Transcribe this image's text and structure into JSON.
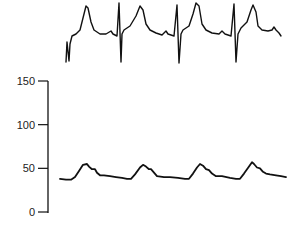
{
  "chart_data": [
    {
      "type": "line",
      "title": "",
      "description": "ECG trace (no axis), aligned above pressure waveform",
      "xlabel": "",
      "ylabel": "",
      "axes_visible": false,
      "beats": 4,
      "qrs_x_px": [
        67,
        119,
        177,
        234
      ],
      "series": [
        {
          "name": "ECG",
          "points_px": [
            [
              66,
              62
            ],
            [
              67,
              42
            ],
            [
              69,
              61
            ],
            [
              70,
              44
            ],
            [
              72,
              36
            ],
            [
              76,
              34
            ],
            [
              80,
              30
            ],
            [
              83,
              18
            ],
            [
              86,
              6
            ],
            [
              88,
              8
            ],
            [
              91,
              22
            ],
            [
              94,
              30
            ],
            [
              100,
              34
            ],
            [
              106,
              34
            ],
            [
              111,
              31
            ],
            [
              113,
              34
            ],
            [
              117,
              36
            ],
            [
              119,
              3
            ],
            [
              121,
              62
            ],
            [
              122,
              34
            ],
            [
              124,
              30
            ],
            [
              130,
              26
            ],
            [
              136,
              16
            ],
            [
              140,
              6
            ],
            [
              143,
              10
            ],
            [
              146,
              24
            ],
            [
              150,
              30
            ],
            [
              156,
              33
            ],
            [
              162,
              35
            ],
            [
              166,
              31
            ],
            [
              168,
              34
            ],
            [
              174,
              36
            ],
            [
              177,
              5
            ],
            [
              179,
              63
            ],
            [
              181,
              34
            ],
            [
              183,
              30
            ],
            [
              189,
              26
            ],
            [
              193,
              14
            ],
            [
              196,
              3
            ],
            [
              199,
              6
            ],
            [
              202,
              24
            ],
            [
              206,
              30
            ],
            [
              212,
              33
            ],
            [
              219,
              34
            ],
            [
              222,
              31
            ],
            [
              225,
              34
            ],
            [
              231,
              36
            ],
            [
              234,
              4
            ],
            [
              236,
              62
            ],
            [
              238,
              34
            ],
            [
              241,
              28
            ],
            [
              247,
              22
            ],
            [
              251,
              10
            ],
            [
              253,
              5
            ],
            [
              256,
              12
            ],
            [
              258,
              26
            ],
            [
              262,
              30
            ],
            [
              268,
              31
            ],
            [
              272,
              30
            ],
            [
              274,
              27
            ],
            [
              276,
              30
            ],
            [
              279,
              33
            ],
            [
              281,
              36
            ]
          ]
        }
      ]
    },
    {
      "type": "line",
      "title": "",
      "xlabel": "",
      "ylabel": "",
      "ylim": [
        0,
        150
      ],
      "yticks": [
        0,
        50,
        100,
        150
      ],
      "ytick_labels": [
        "0",
        "50",
        "100",
        "150"
      ],
      "grid": false,
      "legend": null,
      "series": [
        {
          "name": "Pressure",
          "x_px": [
            60,
            66,
            71,
            75,
            79,
            83,
            87,
            89,
            92,
            95,
            97,
            100,
            104,
            110,
            116,
            122,
            127,
            131,
            135,
            140,
            143,
            146,
            149,
            151,
            154,
            157,
            164,
            170,
            178,
            185,
            189,
            193,
            197,
            200,
            203,
            206,
            209,
            212,
            216,
            222,
            230,
            236,
            240,
            244,
            249,
            252,
            254,
            257,
            260,
            263,
            266,
            270,
            276,
            281,
            286
          ],
          "values": [
            38,
            37,
            37,
            40,
            47,
            54,
            55,
            52,
            49,
            49,
            45,
            42,
            42,
            41,
            40,
            39,
            38,
            38,
            43,
            51,
            54,
            52,
            49,
            49,
            45,
            41,
            40,
            40,
            39,
            38,
            38,
            44,
            51,
            55,
            53,
            49,
            48,
            44,
            41,
            41,
            39,
            38,
            38,
            44,
            52,
            57,
            55,
            51,
            50,
            46,
            44,
            43,
            42,
            41,
            40
          ]
        }
      ]
    }
  ],
  "axis": {
    "ticks": [
      {
        "label": "150",
        "value": 150
      },
      {
        "label": "100",
        "value": 100
      },
      {
        "label": "50",
        "value": 50
      },
      {
        "label": "0",
        "value": 0
      }
    ]
  }
}
